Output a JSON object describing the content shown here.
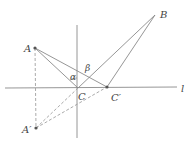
{
  "diagram": {
    "title": "",
    "colors": {
      "line": "#8a8a8a",
      "dashed": "#a0a0a0",
      "point": "#555555",
      "label": "#444444",
      "background": "#ffffff"
    },
    "points": [
      {
        "id": "A",
        "label": "A",
        "x": 35,
        "y": 48
      },
      {
        "id": "B",
        "label": "B",
        "x": 155,
        "y": 15
      },
      {
        "id": "C",
        "label": "C",
        "x": 78,
        "y": 88
      },
      {
        "id": "Cp",
        "label": "C′",
        "x": 107,
        "y": 87
      },
      {
        "id": "Ap",
        "label": "A′",
        "x": 36,
        "y": 128
      }
    ],
    "lines": {
      "l_label": "l",
      "vertical": {
        "x1": 77,
        "y1": 25,
        "x2": 77,
        "y2": 138
      },
      "horizontal": {
        "x1": 5,
        "y1": 88,
        "x2": 177,
        "y2": 87
      }
    },
    "angles": {
      "alpha": "α",
      "beta": "β"
    }
  }
}
